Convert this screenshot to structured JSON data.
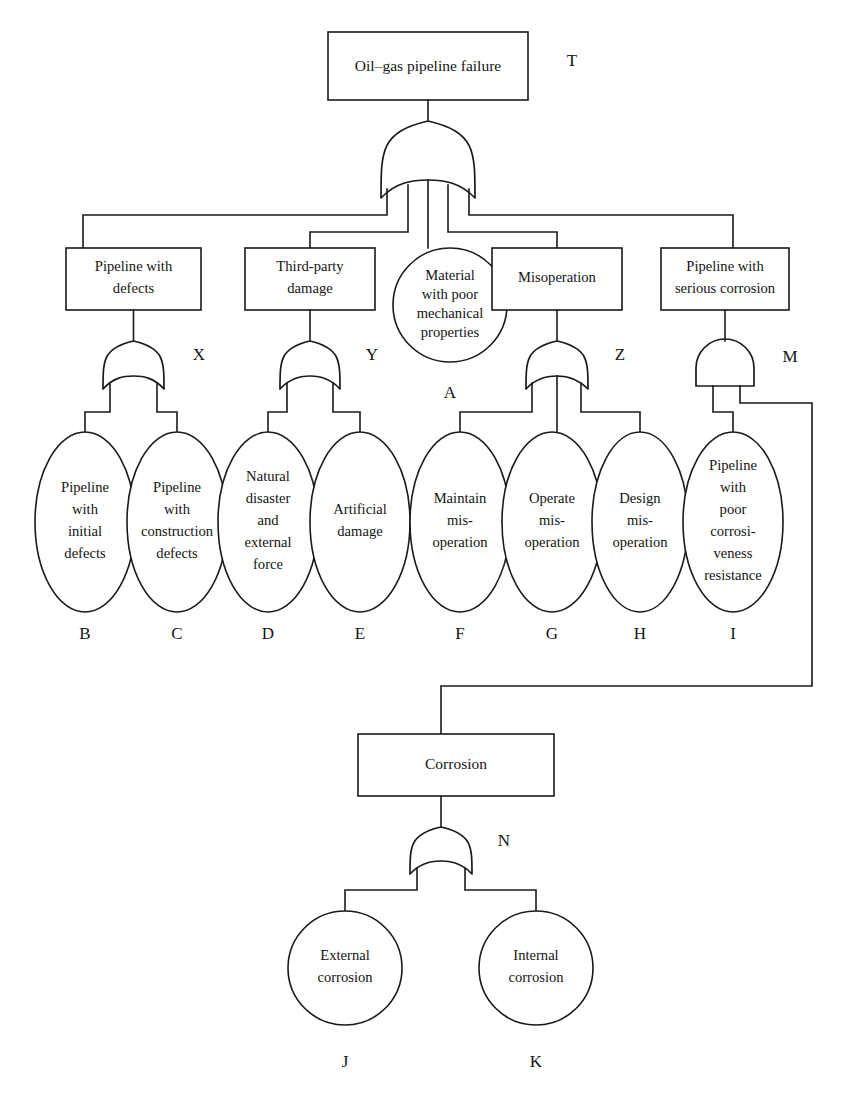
{
  "figure": {
    "kind": "fault-tree-diagram",
    "background_color": "#ffffff",
    "line_color": "#1a1a1a"
  },
  "top_event": {
    "id": "T",
    "shape": "rectangle",
    "text": "Oil–gas pipeline failure",
    "gate_label": "T",
    "gate_type": "or"
  },
  "intermediate_events": [
    {
      "id": "X",
      "shape": "rectangle",
      "line1": "Pipeline with",
      "line2": "defects",
      "gate_label": "X",
      "gate_type": "or"
    },
    {
      "id": "Y",
      "shape": "rectangle",
      "line1": "Third-party",
      "line2": "damage",
      "gate_label": "Y",
      "gate_type": "or"
    },
    {
      "id": "Z",
      "shape": "rectangle",
      "line1": "Misoperation",
      "line2": "",
      "gate_label": "Z",
      "gate_type": "or"
    },
    {
      "id": "M",
      "shape": "rectangle",
      "line1": "Pipeline with",
      "line2": "serious corrosion",
      "gate_label": "M",
      "gate_type": "and"
    },
    {
      "id": "N",
      "shape": "rectangle",
      "line1": "Corrosion",
      "line2": "",
      "gate_label": "N",
      "gate_type": "or"
    }
  ],
  "basic_events": [
    {
      "id": "A",
      "label": "A",
      "shape": "circle",
      "lines": [
        "Material",
        "with poor",
        "mechanical",
        "properties"
      ]
    },
    {
      "id": "B",
      "label": "B",
      "shape": "ellipse",
      "lines": [
        "Pipeline",
        "with",
        "initial",
        "defects"
      ]
    },
    {
      "id": "C",
      "label": "C",
      "shape": "ellipse",
      "lines": [
        "Pipeline",
        "with",
        "construction",
        "defects"
      ]
    },
    {
      "id": "D",
      "label": "D",
      "shape": "ellipse",
      "lines": [
        "Natural",
        "disaster",
        "and",
        "external",
        "force"
      ]
    },
    {
      "id": "E",
      "label": "E",
      "shape": "ellipse",
      "lines": [
        "Artificial",
        "damage"
      ]
    },
    {
      "id": "F",
      "label": "F",
      "shape": "ellipse",
      "lines": [
        "Maintain",
        "mis-",
        "operation"
      ]
    },
    {
      "id": "G",
      "label": "G",
      "shape": "ellipse",
      "lines": [
        "Operate",
        "mis-",
        "operation"
      ]
    },
    {
      "id": "H",
      "label": "H",
      "shape": "ellipse",
      "lines": [
        "Design",
        "mis-",
        "operation"
      ]
    },
    {
      "id": "I",
      "label": "I",
      "shape": "ellipse",
      "lines": [
        "Pipeline",
        "with",
        "poor",
        "corrosi-",
        "veness",
        "resistance"
      ]
    },
    {
      "id": "J",
      "label": "J",
      "shape": "circle",
      "lines": [
        "External",
        "corrosion"
      ]
    },
    {
      "id": "K",
      "label": "K",
      "shape": "circle",
      "lines": [
        "Internal",
        "corrosion"
      ]
    }
  ],
  "text": {
    "t_box": "Oil–gas pipeline failure",
    "t_gate": "T",
    "x_box_l1": "Pipeline with",
    "x_box_l2": "defects",
    "x_gate": "X",
    "y_box_l1": "Third-party",
    "y_box_l2": "damage",
    "y_gate": "Y",
    "z_box_l1": "Misoperation",
    "z_gate": "Z",
    "m_box_l1": "Pipeline with",
    "m_box_l2": "serious corrosion",
    "m_gate": "M",
    "n_box_l1": "Corrosion",
    "n_gate": "N",
    "a_l1": "Material",
    "a_l2": "with poor",
    "a_l3": "mechanical",
    "a_l4": "properties",
    "a_label": "A",
    "b_l1": "Pipeline",
    "b_l2": "with",
    "b_l3": "initial",
    "b_l4": "defects",
    "b_label": "B",
    "c_l1": "Pipeline",
    "c_l2": "with",
    "c_l3": "construction",
    "c_l4": "defects",
    "c_label": "C",
    "d_l1": "Natural",
    "d_l2": "disaster",
    "d_l3": "and",
    "d_l4": "external",
    "d_l5": "force",
    "d_label": "D",
    "e_l1": "Artificial",
    "e_l2": "damage",
    "e_label": "E",
    "f_l1": "Maintain",
    "f_l2": "mis-",
    "f_l3": "operation",
    "f_label": "F",
    "g_l1": "Operate",
    "g_l2": "mis-",
    "g_l3": "operation",
    "g_label": "G",
    "h_l1": "Design",
    "h_l2": "mis-",
    "h_l3": "operation",
    "h_label": "H",
    "i_l1": "Pipeline",
    "i_l2": "with",
    "i_l3": "poor",
    "i_l4": "corrosi-",
    "i_l5": "veness",
    "i_l6": "resistance",
    "i_label": "I",
    "j_l1": "External",
    "j_l2": "corrosion",
    "j_label": "J",
    "k_l1": "Internal",
    "k_l2": "corrosion",
    "k_label": "K"
  }
}
